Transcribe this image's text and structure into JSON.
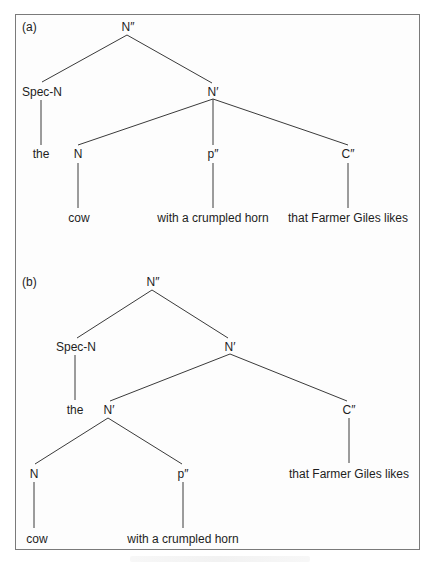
{
  "figure": {
    "panels": [
      {
        "label": "(a)",
        "nodes": {
          "root": "N″",
          "spec": "Spec-N",
          "nbar": "N′",
          "det": "the",
          "n": "N",
          "pp": "p″",
          "cp": "C″",
          "noun": "cow",
          "pp_text": "with a crumpled horn",
          "cp_text": "that Farmer Giles likes"
        }
      },
      {
        "label": "(b)",
        "nodes": {
          "root": "N″",
          "spec": "Spec-N",
          "nbar_upper": "N′",
          "det": "the",
          "nbar_lower": "N′",
          "cp": "C″",
          "n": "N",
          "pp": "p″",
          "cp_text": "that Farmer Giles likes",
          "noun": "cow",
          "pp_text": "with a crumpled horn"
        }
      }
    ],
    "colors": {
      "line": "#3a3a3a",
      "text": "#1e1e1e",
      "border": "#7a7a7a"
    }
  }
}
